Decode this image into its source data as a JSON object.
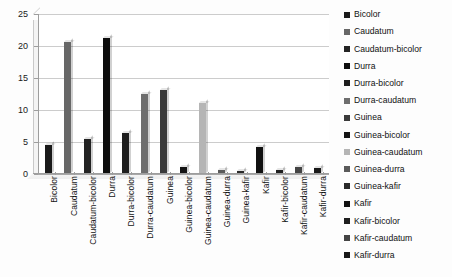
{
  "chart_data": {
    "type": "bar",
    "title": "",
    "xlabel": "",
    "ylabel": "",
    "ylim": [
      0,
      25
    ],
    "yticks": [
      0,
      5,
      10,
      15,
      20,
      25
    ],
    "grid": true,
    "legend_position": "right",
    "categories": [
      "Bicolor",
      "Caudatum",
      "Caudatum-bicolor",
      "Durra",
      "Durra-bicolor",
      "Durra-caudatum",
      "Guinea",
      "Guinea-bicolor",
      "Guinea-caudatum",
      "Guinea-durra",
      "Guinea-kafir",
      "Kafir",
      "Kafir-bicolor",
      "Kafir-caudatum",
      "Kafir-durra"
    ],
    "values": [
      4.3,
      20.5,
      5.3,
      21.1,
      6.3,
      12.3,
      13.0,
      1.0,
      11.0,
      0.5,
      0.3,
      4.0,
      0.5,
      1.0,
      0.8
    ],
    "colors": [
      "#1a1a1a",
      "#676767",
      "#232323",
      "#0d0d0d",
      "#1d1d1d",
      "#6e6e6e",
      "#3a3a3a",
      "#141414",
      "#b5b5b5",
      "#5a5a5a",
      "#2a2a2a",
      "#111111",
      "#1f1f1f",
      "#444444",
      "#181818"
    ]
  },
  "legend": {
    "items": [
      {
        "label": "Bicolor",
        "color": "#1a1a1a"
      },
      {
        "label": "Caudatum",
        "color": "#676767"
      },
      {
        "label": "Caudatum-bicolor",
        "color": "#232323"
      },
      {
        "label": "Durra",
        "color": "#0d0d0d"
      },
      {
        "label": "Durra-bicolor",
        "color": "#1d1d1d"
      },
      {
        "label": "Durra-caudatum",
        "color": "#6e6e6e"
      },
      {
        "label": "Guinea",
        "color": "#3a3a3a"
      },
      {
        "label": "Guinea-bicolor",
        "color": "#141414"
      },
      {
        "label": "Guinea-caudatum",
        "color": "#b5b5b5"
      },
      {
        "label": "Guinea-durra",
        "color": "#5a5a5a"
      },
      {
        "label": "Guinea-kafir",
        "color": "#2a2a2a"
      },
      {
        "label": "Kafir",
        "color": "#111111"
      },
      {
        "label": "Kafir-bicolor",
        "color": "#1f1f1f"
      },
      {
        "label": "Kafir-caudatum",
        "color": "#444444"
      },
      {
        "label": "Kafir-durra",
        "color": "#181818"
      }
    ]
  },
  "axes": {
    "y_tick_labels": [
      "0",
      "5",
      "10",
      "15",
      "20",
      "25"
    ]
  }
}
